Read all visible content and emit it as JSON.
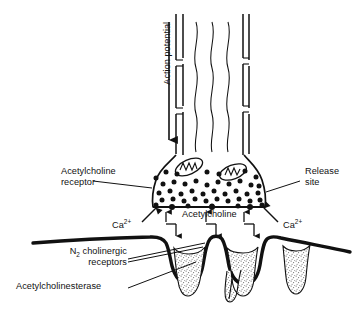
{
  "figure": {
    "labels": {
      "action_potential_line1": "Action",
      "action_potential_line2": "potential",
      "acetylcholine_receptor_line1": "Acetylcholine",
      "acetylcholine_receptor_line2": "receptor",
      "release_site_line1": "Release",
      "release_site_line2": "site",
      "calcium_left_text": "Ca",
      "calcium_left_charge": "2+",
      "calcium_right_text": "Ca",
      "calcium_right_charge": "2+",
      "acetylcholine": "Acetylcholine",
      "n2_receptors_line1_pre": "N",
      "n2_receptors_line1_sub": "2",
      "n2_receptors_line1_post": " cholinergic",
      "n2_receptors_line2": "receptors",
      "acetylcholinesterase": "Acetylcholinesterase"
    },
    "colors": {
      "ink": "#111111",
      "background": "#ffffff",
      "stipple": "#6f6f6f",
      "membrane": "#000000"
    },
    "structures": {
      "axon": "myelinated nerve fiber with nodes",
      "terminal": "presynaptic nerve terminal",
      "mitochondria_count": 2,
      "vesicle_count": 42,
      "release_sites": 3,
      "junctional_folds": 3,
      "cleft_arrows": 3
    }
  }
}
